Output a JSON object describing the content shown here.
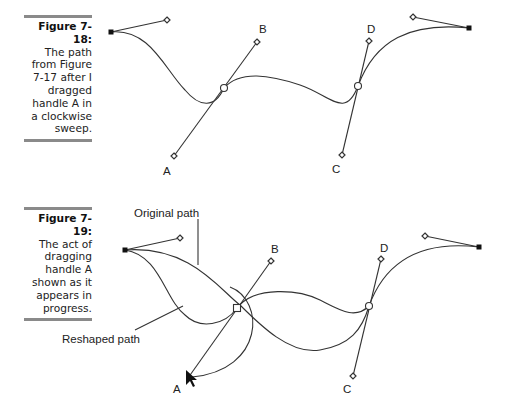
{
  "figures": [
    {
      "number": "Figure 7-18:",
      "caption": "The path from Figure 7-17 after I dragged handle A in a clockwise sweep.",
      "labels": {
        "A": "A",
        "B": "B",
        "C": "C",
        "D": "D"
      }
    },
    {
      "number": "Figure 7-19:",
      "caption": "The act of dragging handle A shown as it appears in progress.",
      "labels": {
        "A": "A",
        "B": "B",
        "C": "C",
        "D": "D",
        "original": "Original path",
        "reshaped": "Reshaped path"
      }
    }
  ]
}
